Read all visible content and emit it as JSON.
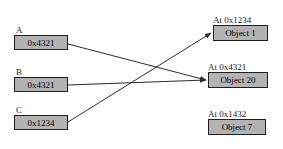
{
  "diagram": {
    "background_color": "#ffffff",
    "box_fill_color": "#b3b3b3",
    "box_border_color": "#1f1f1f",
    "edge_color": "#2b2b2b"
  },
  "pointers": [
    {
      "name": "pointer-a",
      "label": "A",
      "value": "0x4321",
      "label_x": 16,
      "label_y": 25,
      "box_x": 14,
      "box_y": 35,
      "box_w": 54,
      "box_h": 15
    },
    {
      "name": "pointer-b",
      "label": "B",
      "value": "0x4321",
      "label_x": 16,
      "label_y": 67,
      "box_x": 14,
      "box_y": 77,
      "box_w": 54,
      "box_h": 15
    },
    {
      "name": "pointer-c",
      "label": "C",
      "value": "0x1234",
      "label_x": 16,
      "label_y": 105,
      "box_x": 14,
      "box_y": 115,
      "box_w": 54,
      "box_h": 15
    }
  ],
  "objects": [
    {
      "name": "object-1",
      "address_label": "At 0x1234",
      "label": "Object 1",
      "addr_x": 213,
      "addr_y": 15,
      "box_x": 213,
      "box_y": 25,
      "box_w": 55,
      "box_h": 16
    },
    {
      "name": "object-20",
      "address_label": "At 0x4321",
      "label": "Object 20",
      "addr_x": 208,
      "addr_y": 62,
      "box_x": 208,
      "box_y": 72,
      "box_w": 60,
      "box_h": 16
    },
    {
      "name": "object-7",
      "address_label": "At 0x1432",
      "label": "Object 7",
      "addr_x": 208,
      "addr_y": 109,
      "box_x": 208,
      "box_y": 119,
      "box_w": 58,
      "box_h": 16
    }
  ],
  "edges": [
    {
      "name": "edge-a-to-object-20",
      "from": "pointer-a",
      "to": "object-20",
      "x1": 68,
      "y1": 44,
      "x2": 206,
      "y2": 80
    },
    {
      "name": "edge-b-to-object-20",
      "from": "pointer-b",
      "to": "object-20",
      "x1": 68,
      "y1": 85,
      "x2": 206,
      "y2": 80
    },
    {
      "name": "edge-c-to-object-1",
      "from": "pointer-c",
      "to": "object-1",
      "x1": 68,
      "y1": 122,
      "x2": 211,
      "y2": 33
    }
  ]
}
